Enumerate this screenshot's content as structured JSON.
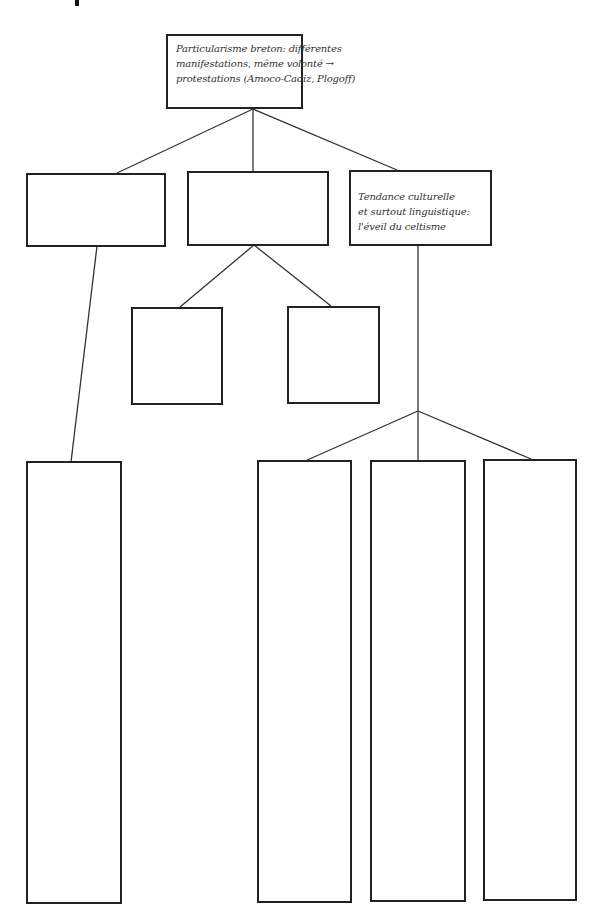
{
  "diagram": {
    "root": {
      "text_lines": [
        "Particularisme breton: différentes",
        "manifestations, même volonté →",
        "protestations (Amoco-Cadiz, Plogoff)"
      ]
    },
    "level1": [
      {
        "id": "left",
        "text_lines": []
      },
      {
        "id": "middle",
        "text_lines": []
      },
      {
        "id": "right",
        "text_lines": [
          "Tendance culturelle",
          "et surtout linguistique:",
          "l'éveil du celtisme"
        ]
      }
    ],
    "level2_middle": [
      {
        "id": "middle-a",
        "text_lines": []
      },
      {
        "id": "middle-b",
        "text_lines": []
      }
    ],
    "level2_left": [
      {
        "id": "left-a",
        "text_lines": []
      }
    ],
    "level2_right": [
      {
        "id": "right-a",
        "text_lines": []
      },
      {
        "id": "right-b",
        "text_lines": []
      },
      {
        "id": "right-c",
        "text_lines": []
      }
    ],
    "colors": {
      "line": "#222222",
      "text": "#333333",
      "background": "#ffffff"
    }
  }
}
